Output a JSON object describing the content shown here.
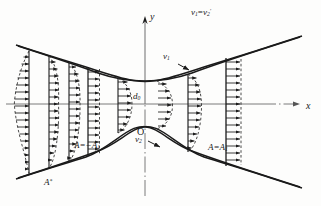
{
  "figure": {
    "kind": "hyperbolic-nozzle-velocity-profiles",
    "axes": {
      "x_label": "x",
      "y_label": "y",
      "origin_label": "O"
    },
    "labels": {
      "top_relation": "v",
      "top_relation_sub1": "1",
      "top_relation_eq": "=",
      "top_relation_v2": "v",
      "top_relation_sub2": "2",
      "top_relation_prime": "'",
      "throat_diameter": "d",
      "throat_diameter_sub": "0",
      "velocity_upper": "v",
      "velocity_upper_sub": "1",
      "velocity_lower": "v",
      "velocity_lower_sub": "2",
      "area_left": "A=−A",
      "area_left_sub": "1",
      "area_right": "A=A",
      "area_right_sub": "1",
      "area_star": "A",
      "area_star_sup": "*"
    },
    "colors": {
      "ink": "#1a1a1a",
      "axis": "#6f6f6f",
      "dashed": "#2a2a2a",
      "background": "#fdfdfc"
    },
    "geometry": {
      "origin_px": [
        145,
        104
      ],
      "throat_half_height_px": 23,
      "x_axis_y_px": 104,
      "y_axis_x_px": 145
    },
    "stations": [
      {
        "name": "station-far-left",
        "x_px": 28,
        "direction": "left",
        "profile": "bulge-reverse",
        "label": "A*"
      },
      {
        "name": "station-left-4",
        "x_px": 48,
        "direction": "right",
        "profile": "s-curve",
        "label": ""
      },
      {
        "name": "station-left-3",
        "x_px": 68,
        "direction": "right",
        "profile": "rounded",
        "label": ""
      },
      {
        "name": "station-left-2",
        "x_px": 86,
        "direction": "right",
        "profile": "uniform",
        "label": "A=−A1"
      },
      {
        "name": "station-left-1",
        "x_px": 117,
        "direction": "right",
        "profile": "rounded",
        "label": ""
      },
      {
        "name": "station-throat",
        "x_px": 158,
        "direction": "right",
        "profile": "rounded-peak",
        "label": "d0"
      },
      {
        "name": "station-right-1",
        "x_px": 186,
        "direction": "right",
        "profile": "rounded",
        "label": ""
      },
      {
        "name": "station-right-2",
        "x_px": 225,
        "direction": "right",
        "profile": "uniform",
        "label": "A=A1"
      }
    ]
  }
}
